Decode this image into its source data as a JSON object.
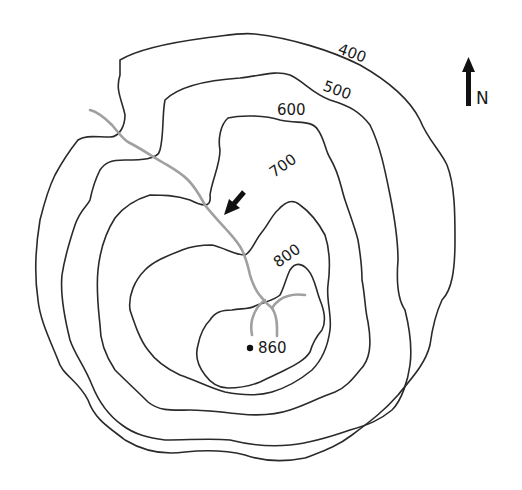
{
  "map": {
    "type": "topographic contour map",
    "contour_labels": [
      {
        "value": "400",
        "x": 337,
        "y": 53,
        "rotate": 20
      },
      {
        "value": "500",
        "x": 322,
        "y": 90,
        "rotate": 20
      },
      {
        "value": "600",
        "x": 277,
        "y": 115,
        "rotate": 0
      },
      {
        "value": "700",
        "x": 271,
        "y": 180,
        "rotate": -35
      },
      {
        "value": "800",
        "x": 274,
        "y": 270,
        "rotate": -35
      }
    ],
    "summit": {
      "label": "860",
      "x": 250,
      "y": 348
    },
    "north_arrow": {
      "label": "N"
    },
    "colors": {
      "contour": "#2a2a2a",
      "stream": "#a0a0a0",
      "background": "#ffffff"
    }
  }
}
